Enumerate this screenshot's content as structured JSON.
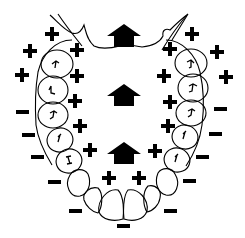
{
  "diagram": {
    "colors": {
      "stroke": "#000000",
      "fill": "#000000",
      "background": "#ffffff"
    },
    "arrows": [
      {
        "id": "arrow-top",
        "cx": 124,
        "cy": 36,
        "direction": "up"
      },
      {
        "id": "arrow-middle",
        "cx": 124,
        "cy": 95,
        "direction": "up"
      },
      {
        "id": "arrow-bottom",
        "cx": 124,
        "cy": 153,
        "direction": "up"
      }
    ],
    "signs": [
      {
        "type": "plus",
        "x": 52,
        "y": 34,
        "side": "left-outer"
      },
      {
        "type": "plus",
        "x": 30,
        "y": 51,
        "side": "left-outer"
      },
      {
        "type": "plus",
        "x": 22,
        "y": 75,
        "side": "left-outer"
      },
      {
        "type": "minus",
        "x": 23,
        "y": 112,
        "side": "left-outer"
      },
      {
        "type": "minus",
        "x": 29,
        "y": 135,
        "side": "left-outer"
      },
      {
        "type": "minus",
        "x": 38,
        "y": 157,
        "side": "left-outer"
      },
      {
        "type": "minus",
        "x": 55,
        "y": 182,
        "side": "left-outer"
      },
      {
        "type": "minus",
        "x": 76,
        "y": 211,
        "side": "left-outer"
      },
      {
        "type": "plus",
        "x": 77,
        "y": 50,
        "side": "left-inner"
      },
      {
        "type": "plus",
        "x": 77,
        "y": 76,
        "side": "left-inner"
      },
      {
        "type": "plus",
        "x": 75,
        "y": 101,
        "side": "left-inner"
      },
      {
        "type": "plus",
        "x": 80,
        "y": 126,
        "side": "left-inner"
      },
      {
        "type": "plus",
        "x": 90,
        "y": 150,
        "side": "left-inner"
      },
      {
        "type": "plus",
        "x": 109,
        "y": 178,
        "side": "bottom-inner"
      },
      {
        "type": "plus",
        "x": 139,
        "y": 178,
        "side": "bottom-inner"
      },
      {
        "type": "minus",
        "x": 124,
        "y": 226,
        "side": "bottom-outer"
      },
      {
        "type": "plus",
        "x": 192,
        "y": 34,
        "side": "right-outer"
      },
      {
        "type": "plus",
        "x": 217,
        "y": 52,
        "side": "right-outer"
      },
      {
        "type": "plus",
        "x": 226,
        "y": 77,
        "side": "right-outer"
      },
      {
        "type": "minus",
        "x": 221,
        "y": 109,
        "side": "right-outer"
      },
      {
        "type": "minus",
        "x": 216,
        "y": 134,
        "side": "right-outer"
      },
      {
        "type": "minus",
        "x": 203,
        "y": 157,
        "side": "right-outer"
      },
      {
        "type": "minus",
        "x": 190,
        "y": 181,
        "side": "right-outer"
      },
      {
        "type": "minus",
        "x": 171,
        "y": 211,
        "side": "right-outer"
      },
      {
        "type": "plus",
        "x": 170,
        "y": 49,
        "side": "right-inner"
      },
      {
        "type": "plus",
        "x": 164,
        "y": 76,
        "side": "right-inner"
      },
      {
        "type": "plus",
        "x": 170,
        "y": 102,
        "side": "right-inner"
      },
      {
        "type": "plus",
        "x": 168,
        "y": 126,
        "side": "right-inner"
      },
      {
        "type": "plus",
        "x": 155,
        "y": 151,
        "side": "right-inner"
      }
    ]
  }
}
